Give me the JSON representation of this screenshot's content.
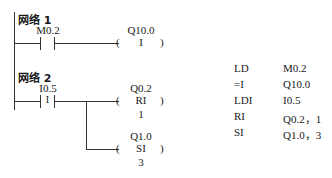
{
  "networks": [
    {
      "title": "网络 1",
      "contact": {
        "address": "M0.2",
        "type": "normally-open",
        "symbol": ""
      },
      "coils": [
        {
          "address": "Q10.0",
          "instruction": "I",
          "param": ""
        }
      ]
    },
    {
      "title": "网络 2",
      "contact": {
        "address": "I0.5",
        "type": "immediate-normally-open",
        "symbol": "I"
      },
      "coils": [
        {
          "address": "Q0.2",
          "instruction": "RI",
          "param": "1"
        },
        {
          "address": "Q1.0",
          "instruction": "SI",
          "param": "3"
        }
      ]
    }
  ],
  "statement_list": [
    {
      "op": "LD",
      "operand": "M0.2"
    },
    {
      "op": "=I",
      "operand": "Q10.0"
    },
    {
      "op": "LDI",
      "operand": "I0.5"
    },
    {
      "op": "RI",
      "operand": "Q0.2，1"
    },
    {
      "op": "SI",
      "operand": "Q1.0，3"
    }
  ],
  "coil_paren_left": "(",
  "coil_paren_right": ")"
}
